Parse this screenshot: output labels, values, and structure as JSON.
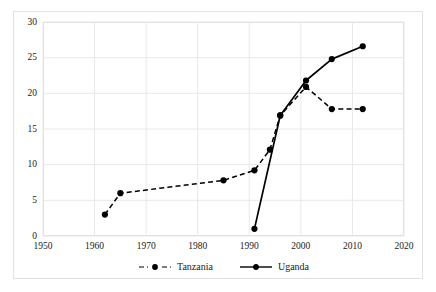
{
  "chart_data": {
    "type": "line",
    "title": "",
    "subtitle": "",
    "xlabel": "",
    "ylabel": "",
    "xlim": [
      1950,
      2020
    ],
    "ylim": [
      0,
      30
    ],
    "xticks": [
      1950,
      1960,
      1970,
      1980,
      1990,
      2000,
      2010,
      2020
    ],
    "yticks": [
      0,
      5,
      10,
      15,
      20,
      25,
      30
    ],
    "grid": true,
    "legend_position": "bottom-center",
    "series": [
      {
        "name": "Tanzania",
        "style": "dashed",
        "marker": "circle",
        "color": "#000000",
        "points": [
          {
            "x": 1962,
            "y": 3.0
          },
          {
            "x": 1965,
            "y": 6.0
          },
          {
            "x": 1985,
            "y": 7.8
          },
          {
            "x": 1991,
            "y": 9.2
          },
          {
            "x": 1994,
            "y": 12.1
          },
          {
            "x": 1996,
            "y": 16.9
          },
          {
            "x": 2001,
            "y": 20.9
          },
          {
            "x": 2006,
            "y": 17.8
          },
          {
            "x": 2012,
            "y": 17.8
          }
        ]
      },
      {
        "name": "Uganda",
        "style": "solid",
        "marker": "circle",
        "color": "#000000",
        "points": [
          {
            "x": 1991,
            "y": 1.0
          },
          {
            "x": 1996,
            "y": 16.9
          },
          {
            "x": 2001,
            "y": 21.8
          },
          {
            "x": 2006,
            "y": 24.8
          },
          {
            "x": 2012,
            "y": 26.6
          }
        ]
      }
    ]
  },
  "legend": {
    "entries": [
      {
        "label": "Tanzania"
      },
      {
        "label": "Uganda"
      }
    ]
  },
  "axes": {
    "y_labels": [
      "30",
      "25",
      "20",
      "15",
      "10",
      "5",
      "0"
    ],
    "x_labels": [
      "1950",
      "1960",
      "1970",
      "1980",
      "1990",
      "2000",
      "2010",
      "2020"
    ]
  },
  "colors": {
    "series": "#000000",
    "grid": "#e8e8e8",
    "frame": "#dcdcdc",
    "outer_frame": "#e2e2e2",
    "text": "#1a1a1a",
    "background": "#ffffff"
  }
}
